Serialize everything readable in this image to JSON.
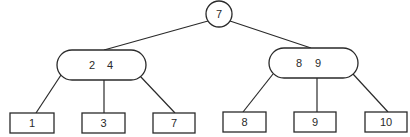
{
  "diagram": {
    "type": "2-3 tree",
    "root": {
      "label": "7",
      "shape": "circle",
      "cx": 219,
      "cy": 14,
      "r": 13
    },
    "internal_nodes": [
      {
        "id": "left",
        "keys": [
          "2",
          "4"
        ],
        "shape": "pill",
        "x": 57,
        "y": 50,
        "w": 89,
        "h": 30,
        "key_x": [
          92,
          110
        ],
        "text_y": 69
      },
      {
        "id": "right",
        "keys": [
          "8",
          "9"
        ],
        "shape": "pill",
        "x": 269,
        "y": 48,
        "w": 89,
        "h": 30,
        "key_x": [
          299,
          318
        ],
        "text_y": 67
      }
    ],
    "leaves": [
      {
        "label": "1",
        "parent": "left",
        "x": 10,
        "y": 113,
        "w": 44,
        "h": 20
      },
      {
        "label": "3",
        "parent": "left",
        "x": 82,
        "y": 113,
        "w": 43,
        "h": 20
      },
      {
        "label": "7",
        "parent": "left",
        "x": 153,
        "y": 113,
        "w": 42,
        "h": 20
      },
      {
        "label": "8",
        "parent": "right",
        "x": 223,
        "y": 112,
        "w": 43,
        "h": 20
      },
      {
        "label": "9",
        "parent": "right",
        "x": 294,
        "y": 112,
        "w": 42,
        "h": 20
      },
      {
        "label": "10",
        "parent": "right",
        "x": 365,
        "y": 112,
        "w": 42,
        "h": 20
      }
    ],
    "edges": [
      {
        "from": "root",
        "to": "left",
        "x1": 208,
        "y1": 21,
        "x2": 104,
        "y2": 50
      },
      {
        "from": "root",
        "to": "right",
        "x1": 230,
        "y1": 21,
        "x2": 311,
        "y2": 48
      },
      {
        "from": "left",
        "to": "leaf-1",
        "x1": 61,
        "y1": 75,
        "x2": 36,
        "y2": 113
      },
      {
        "from": "left",
        "to": "leaf-3",
        "x1": 104,
        "y1": 80,
        "x2": 104,
        "y2": 113
      },
      {
        "from": "left",
        "to": "leaf-7",
        "x1": 140,
        "y1": 76,
        "x2": 175,
        "y2": 113
      },
      {
        "from": "right",
        "to": "leaf-8",
        "x1": 273,
        "y1": 74,
        "x2": 243,
        "y2": 112
      },
      {
        "from": "right",
        "to": "leaf-9",
        "x1": 317,
        "y1": 78,
        "x2": 317,
        "y2": 112
      },
      {
        "from": "right",
        "to": "leaf-10",
        "x1": 353,
        "y1": 74,
        "x2": 388,
        "y2": 112
      }
    ],
    "colors": {
      "stroke": "#2a2a2a",
      "fill": "#ffffff",
      "text": "#2a2a2a"
    }
  }
}
